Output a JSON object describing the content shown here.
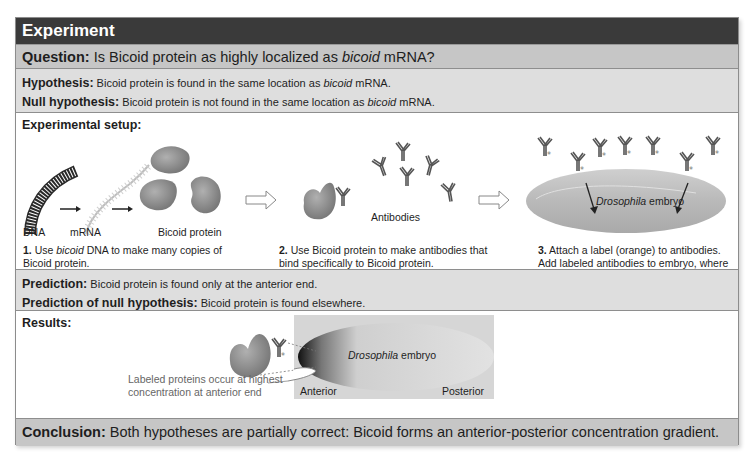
{
  "header": {
    "title": "Experiment"
  },
  "question": {
    "label": "Question:",
    "text_before": " Is Bicoid protein as highly localized as ",
    "text_italic": "bicoid",
    "text_after": " mRNA?"
  },
  "hypothesis": {
    "label": "Hypothesis:",
    "text_before": " Bicoid protein is found in the same location as ",
    "text_italic": "bicoid",
    "text_after": " mRNA."
  },
  "null_hypothesis": {
    "label": "Null hypothesis:",
    "text_before": " Bicoid protein is not found in the same location as ",
    "text_italic": "bicoid",
    "text_after": " mRNA."
  },
  "setup": {
    "title": "Experimental setup:",
    "labels": {
      "dna": "DNA",
      "mrna": "mRNA",
      "protein": "Bicoid protein",
      "antibodies": "Antibodies",
      "embryo_italic": "Drosophila",
      "embryo_rest": " embryo"
    },
    "steps": [
      {
        "num": "1.",
        "before": " Use ",
        "italic": "bicoid",
        "after": " DNA to make many copies of Bicoid protein."
      },
      {
        "num": "2.",
        "text": " Use Bicoid protein to make antibodies that bind specifically to Bicoid protein."
      },
      {
        "num": "3.",
        "text": " Attach a label (orange) to antibodies. Add labeled antibodies to embryo, where they will bind to Bicoid protein."
      }
    ]
  },
  "prediction": {
    "label": "Prediction:",
    "text": " Bicoid protein is found only at the anterior end."
  },
  "null_prediction": {
    "label": "Prediction of null hypothesis:",
    "text": " Bicoid protein is found elsewhere."
  },
  "results": {
    "title": "Results:",
    "annotation": "Labeled proteins occur at highest concentration at anterior end",
    "embryo_italic": "Drosophila",
    "embryo_rest": " embryo",
    "anterior": "Anterior",
    "posterior": "Posterior"
  },
  "conclusion": {
    "label": "Conclusion:",
    "text": " Both hypotheses are partially correct: Bicoid forms an anterior-posterior concentration gradient."
  },
  "colors": {
    "header_bg": "#3a3a3a",
    "question_bg": "#c6c6c6",
    "hypothesis_bg": "#dedede",
    "protein": "#8a8a8a"
  }
}
